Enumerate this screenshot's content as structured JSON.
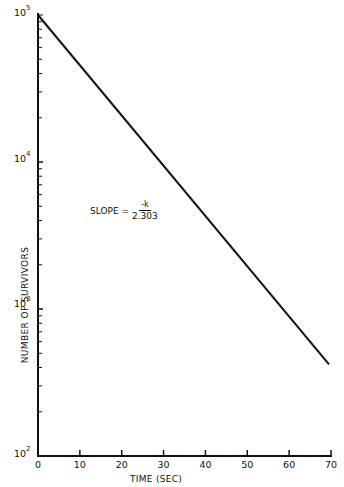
{
  "chart_data": {
    "type": "line",
    "title": "",
    "xlabel": "TIME (SEC)",
    "ylabel": "NUMBER OF SURVIVORS",
    "yscale": "log",
    "xlim": [
      0,
      70
    ],
    "ylim": [
      100,
      100000
    ],
    "x_ticks": [
      "0",
      "10",
      "20",
      "30",
      "40",
      "50",
      "60",
      "70"
    ],
    "y_ticks": [
      {
        "base": "10",
        "exp": "2"
      },
      {
        "base": "10",
        "exp": "3"
      },
      {
        "base": "10",
        "exp": "4"
      },
      {
        "base": "10",
        "exp": "5"
      }
    ],
    "series": [
      {
        "name": "survivors",
        "x": [
          0,
          70
        ],
        "y": [
          100000,
          420
        ]
      }
    ],
    "annotation": {
      "prefix": "SLOPE =",
      "numerator": "-k",
      "denominator": "2.303"
    },
    "grid": false,
    "legend": null
  }
}
